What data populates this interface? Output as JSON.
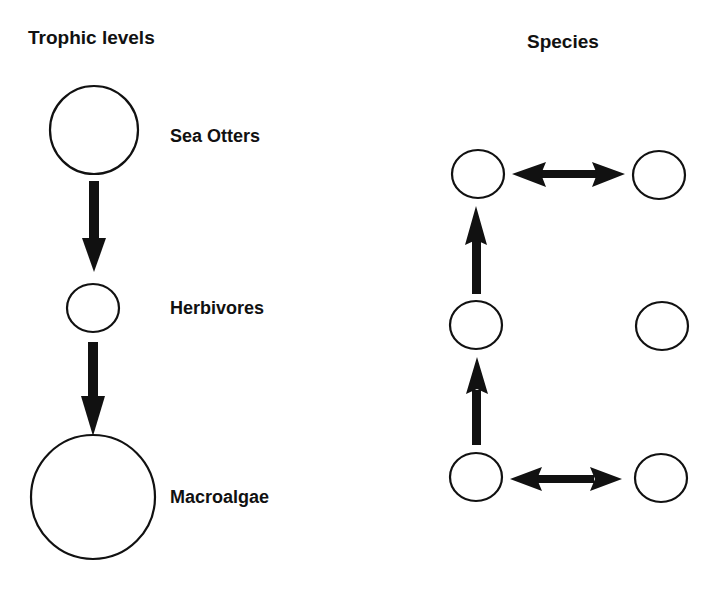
{
  "colors": {
    "ink": "#111111",
    "background": "#ffffff"
  },
  "left_panel": {
    "title": "Trophic levels",
    "levels": [
      {
        "label": "Sea Otters",
        "cx": 94,
        "cy": 130,
        "rx": 44,
        "ry": 44
      },
      {
        "label": "Herbivores",
        "cx": 93,
        "cy": 308,
        "rx": 26,
        "ry": 24
      },
      {
        "label": "Macroalgae",
        "cx": 93,
        "cy": 497,
        "rx": 62,
        "ry": 62
      }
    ],
    "arrows": [
      {
        "from": "Sea Otters",
        "to": "Herbivores",
        "direction": "down"
      },
      {
        "from": "Herbivores",
        "to": "Macroalgae",
        "direction": "down"
      }
    ]
  },
  "right_panel": {
    "title": "Species",
    "nodes": [
      {
        "id": "top-left",
        "cx": 478,
        "cy": 174
      },
      {
        "id": "top-right",
        "cx": 659,
        "cy": 175
      },
      {
        "id": "mid-left",
        "cx": 476,
        "cy": 325
      },
      {
        "id": "mid-right",
        "cx": 662,
        "cy": 326
      },
      {
        "id": "bottom-left",
        "cx": 476,
        "cy": 477
      },
      {
        "id": "bottom-right",
        "cx": 661,
        "cy": 478
      }
    ],
    "arrows": [
      {
        "from": "top-left",
        "to": "top-right",
        "type": "bidirectional"
      },
      {
        "from": "mid-left",
        "to": "top-left",
        "type": "up"
      },
      {
        "from": "bottom-left",
        "to": "mid-left",
        "type": "up"
      },
      {
        "from": "bottom-left",
        "to": "bottom-right",
        "type": "bidirectional"
      }
    ]
  }
}
